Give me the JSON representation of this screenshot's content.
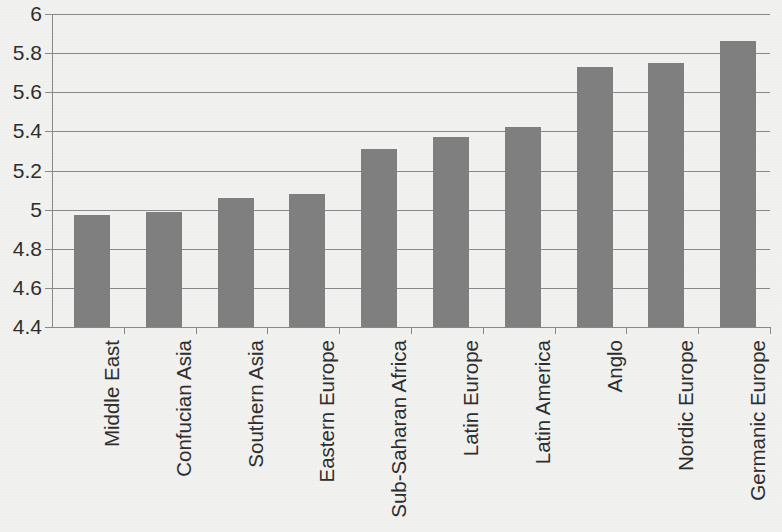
{
  "chart_data": {
    "type": "bar",
    "title": "",
    "subtitle": "",
    "xlabel": "",
    "ylabel": "",
    "orientation": "vertical",
    "grid": true,
    "legend": false,
    "legend_position": "none",
    "bar_color": "#808080",
    "gridline_color": "#8a8a8a",
    "background_color": "#f2f2f0",
    "ylim": [
      4.4,
      6.0
    ],
    "ytick_step": 0.2,
    "ytick_labels": [
      "6",
      "5.8",
      "5.6",
      "5.4",
      "5.2",
      "5",
      "4.8",
      "4.6",
      "4.4"
    ],
    "ytick_values": [
      6.0,
      5.8,
      5.6,
      5.4,
      5.2,
      5.0,
      4.8,
      4.6,
      4.4
    ],
    "categories": [
      "Middle East",
      "Confucian Asia",
      "Southern Asia",
      "Eastern Europe",
      "Sub-Saharan Africa",
      "Latin Europe",
      "Latin America",
      "Anglo",
      "Nordic Europe",
      "Germanic Europe"
    ],
    "values": [
      4.97,
      4.99,
      5.06,
      5.08,
      5.31,
      5.37,
      5.42,
      5.73,
      5.75,
      5.86
    ],
    "category_label_rotation": -90
  }
}
